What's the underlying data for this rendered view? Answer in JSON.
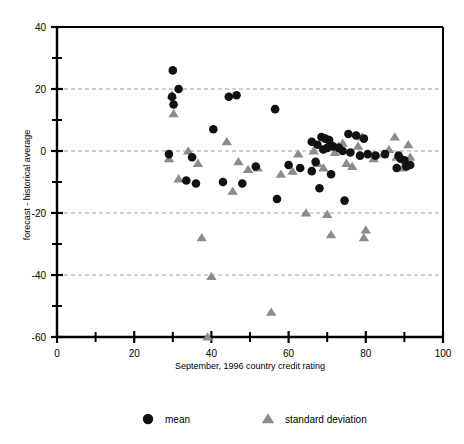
{
  "chart_data": {
    "type": "scatter",
    "title": "",
    "xlabel": "September, 1996 country credit rating",
    "ylabel": "forecast - historical average",
    "xlim": [
      0,
      100
    ],
    "ylim": [
      -60,
      40
    ],
    "xticks": [
      0,
      20,
      40,
      60,
      80,
      100
    ],
    "xticks_minor": [
      10,
      30,
      50,
      70,
      90
    ],
    "yticks": [
      40,
      20,
      0,
      -20,
      -40,
      -60
    ],
    "yticks_minor": [
      30,
      10,
      -10,
      -30,
      -50
    ],
    "xtick_labels": [
      "0",
      "20",
      "40",
      "60",
      "80",
      "100"
    ],
    "ytick_labels": [
      "40",
      "20",
      "0",
      "-20",
      "-40",
      "-60"
    ],
    "grid": true,
    "gridlines_y": [
      20,
      0,
      -20,
      -40
    ],
    "grid_style": "dashed",
    "grid_color": "#999999",
    "legend_position": "bottom",
    "series": [
      {
        "name": "mean",
        "marker": "circle",
        "color": "#111111",
        "points": [
          [
            30.0,
            26.0
          ],
          [
            31.5,
            20.0
          ],
          [
            29.8,
            17.5
          ],
          [
            30.2,
            15.0
          ],
          [
            29.0,
            -1.0
          ],
          [
            35.0,
            -2.0
          ],
          [
            33.5,
            -9.5
          ],
          [
            36.0,
            -10.5
          ],
          [
            40.5,
            7.0
          ],
          [
            44.5,
            17.5
          ],
          [
            46.5,
            18.0
          ],
          [
            43.0,
            -10.0
          ],
          [
            48.0,
            -10.5
          ],
          [
            56.5,
            13.5
          ],
          [
            51.5,
            -5.0
          ],
          [
            60.0,
            -4.5
          ],
          [
            57.0,
            -15.5
          ],
          [
            63.0,
            -5.5
          ],
          [
            66.0,
            3.0
          ],
          [
            67.5,
            2.0
          ],
          [
            68.5,
            4.5
          ],
          [
            69.5,
            4.0
          ],
          [
            70.5,
            3.5
          ],
          [
            69.0,
            0.5
          ],
          [
            70.0,
            1.0
          ],
          [
            71.5,
            1.5
          ],
          [
            67.0,
            -3.5
          ],
          [
            66.0,
            -6.5
          ],
          [
            71.0,
            -7.5
          ],
          [
            68.0,
            -12.0
          ],
          [
            74.5,
            -16.0
          ],
          [
            75.5,
            5.5
          ],
          [
            77.5,
            5.0
          ],
          [
            79.5,
            4.0
          ],
          [
            76.0,
            -0.5
          ],
          [
            78.5,
            -1.5
          ],
          [
            80.5,
            -1.0
          ],
          [
            82.5,
            -1.5
          ],
          [
            85.0,
            -1.0
          ],
          [
            88.5,
            -1.5
          ],
          [
            89.0,
            -2.5
          ],
          [
            90.0,
            -3.0
          ],
          [
            88.0,
            -5.5
          ],
          [
            90.5,
            -5.0
          ],
          [
            91.5,
            -4.5
          ],
          [
            74.0,
            0.0
          ],
          [
            73.0,
            1.0
          ]
        ]
      },
      {
        "name": "standard deviation",
        "marker": "triangle",
        "color": "#8c8c8c",
        "points": [
          [
            29.8,
            18.0
          ],
          [
            30.2,
            12.0
          ],
          [
            29.0,
            -2.5
          ],
          [
            31.5,
            -9.0
          ],
          [
            34.0,
            0.0
          ],
          [
            36.5,
            -4.0
          ],
          [
            37.5,
            -28.0
          ],
          [
            39.0,
            -60.0
          ],
          [
            40.0,
            -40.5
          ],
          [
            44.0,
            3.0
          ],
          [
            45.5,
            -13.0
          ],
          [
            47.0,
            -3.5
          ],
          [
            49.5,
            -6.0
          ],
          [
            52.0,
            -5.5
          ],
          [
            55.5,
            -52.0
          ],
          [
            58.0,
            -7.5
          ],
          [
            61.0,
            -6.5
          ],
          [
            64.5,
            -20.0
          ],
          [
            66.5,
            0.0
          ],
          [
            67.5,
            -4.0
          ],
          [
            69.0,
            -5.5
          ],
          [
            70.0,
            -20.5
          ],
          [
            71.0,
            -27.0
          ],
          [
            73.0,
            1.5
          ],
          [
            74.0,
            2.5
          ],
          [
            75.0,
            -4.0
          ],
          [
            76.5,
            -5.0
          ],
          [
            78.0,
            1.5
          ],
          [
            79.0,
            4.5
          ],
          [
            79.5,
            -28.0
          ],
          [
            80.0,
            -25.5
          ],
          [
            82.0,
            -2.5
          ],
          [
            84.5,
            -1.0
          ],
          [
            86.0,
            0.5
          ],
          [
            87.5,
            4.5
          ],
          [
            88.0,
            -2.0
          ],
          [
            89.5,
            -5.5
          ],
          [
            91.0,
            2.0
          ],
          [
            91.5,
            -2.0
          ],
          [
            62.5,
            -1.0
          ],
          [
            72.0,
            -0.5
          ]
        ]
      }
    ]
  },
  "legend": {
    "items": [
      {
        "label": "mean",
        "marker": "circle",
        "color": "#111111"
      },
      {
        "label": "standard deviation",
        "marker": "triangle",
        "color": "#8c8c8c"
      }
    ]
  }
}
